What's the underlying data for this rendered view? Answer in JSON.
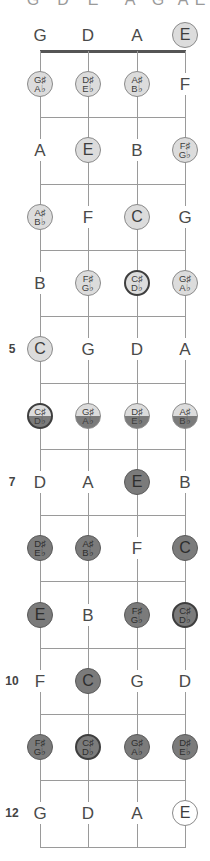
{
  "diagram": {
    "title_cutoff": [
      "G",
      "D",
      "E",
      "A",
      "G",
      "A",
      "E"
    ],
    "strings": [
      "G",
      "D",
      "A",
      "E"
    ],
    "string_x": [
      40,
      88,
      137,
      185
    ],
    "nut_y": 51,
    "fret_spacing": 66.3,
    "colors": {
      "line": "#9a9a9a",
      "nut": "#555555",
      "light_dot": "#dcdcdc",
      "dark_dot": "#7b7b7b",
      "text": "#4a4a4a"
    },
    "rows": [
      {
        "fret": 0,
        "label": "",
        "cells": [
          {
            "note": "G",
            "style": "plain"
          },
          {
            "note": "D",
            "style": "plain"
          },
          {
            "note": "A",
            "style": "plain"
          },
          {
            "note": "E",
            "style": "light"
          }
        ]
      },
      {
        "fret": 1,
        "label": "",
        "cells": [
          {
            "sharp": "G♯",
            "flat": "A♭",
            "style": "light"
          },
          {
            "sharp": "D♯",
            "flat": "E♭",
            "style": "light"
          },
          {
            "sharp": "A♯",
            "flat": "B♭",
            "style": "light"
          },
          {
            "note": "F",
            "style": "plain"
          }
        ]
      },
      {
        "fret": 2,
        "label": "",
        "cells": [
          {
            "note": "A",
            "style": "plain"
          },
          {
            "note": "E",
            "style": "light"
          },
          {
            "note": "B",
            "style": "plain"
          },
          {
            "sharp": "F♯",
            "flat": "G♭",
            "style": "light"
          }
        ]
      },
      {
        "fret": 3,
        "label": "",
        "cells": [
          {
            "sharp": "A♯",
            "flat": "B♭",
            "style": "light"
          },
          {
            "note": "F",
            "style": "plain"
          },
          {
            "note": "C",
            "style": "light"
          },
          {
            "note": "G",
            "style": "plain"
          }
        ]
      },
      {
        "fret": 4,
        "label": "",
        "cells": [
          {
            "note": "B",
            "style": "plain"
          },
          {
            "sharp": "F♯",
            "flat": "G♭",
            "style": "light"
          },
          {
            "sharp": "C♯",
            "flat": "D♭",
            "style": "light ring"
          },
          {
            "sharp": "G♯",
            "flat": "A♭",
            "style": "light"
          }
        ]
      },
      {
        "fret": 5,
        "label": "5",
        "cells": [
          {
            "note": "C",
            "style": "light"
          },
          {
            "note": "G",
            "style": "plain"
          },
          {
            "note": "D",
            "style": "plain"
          },
          {
            "note": "A",
            "style": "plain"
          }
        ]
      },
      {
        "fret": 6,
        "label": "",
        "cells": [
          {
            "sharp": "C♯",
            "flat": "D♭",
            "style": "split ring"
          },
          {
            "sharp": "G♯",
            "flat": "A♭",
            "style": "split"
          },
          {
            "sharp": "D♯",
            "flat": "E♭",
            "style": "split"
          },
          {
            "sharp": "A♯",
            "flat": "B♭",
            "style": "split"
          }
        ]
      },
      {
        "fret": 7,
        "label": "7",
        "cells": [
          {
            "note": "D",
            "style": "plain"
          },
          {
            "note": "A",
            "style": "plain"
          },
          {
            "note": "E",
            "style": "dark"
          },
          {
            "note": "B",
            "style": "plain"
          }
        ]
      },
      {
        "fret": 8,
        "label": "",
        "cells": [
          {
            "sharp": "D♯",
            "flat": "E♭",
            "style": "dark"
          },
          {
            "sharp": "A♯",
            "flat": "B♭",
            "style": "dark"
          },
          {
            "note": "F",
            "style": "plain"
          },
          {
            "note": "C",
            "style": "dark"
          }
        ]
      },
      {
        "fret": 9,
        "label": "",
        "cells": [
          {
            "note": "E",
            "style": "dark"
          },
          {
            "note": "B",
            "style": "plain"
          },
          {
            "sharp": "F♯",
            "flat": "G♭",
            "style": "dark"
          },
          {
            "sharp": "C♯",
            "flat": "D♭",
            "style": "dark ring"
          }
        ]
      },
      {
        "fret": 10,
        "label": "10",
        "cells": [
          {
            "note": "F",
            "style": "plain"
          },
          {
            "note": "C",
            "style": "dark"
          },
          {
            "note": "G",
            "style": "plain"
          },
          {
            "note": "D",
            "style": "plain"
          }
        ]
      },
      {
        "fret": 11,
        "label": "",
        "cells": [
          {
            "sharp": "F♯",
            "flat": "G♭",
            "style": "dark"
          },
          {
            "sharp": "C♯",
            "flat": "D♭",
            "style": "dark ring"
          },
          {
            "sharp": "G♯",
            "flat": "A♭",
            "style": "dark"
          },
          {
            "sharp": "D♯",
            "flat": "E♭",
            "style": "dark"
          }
        ]
      },
      {
        "fret": 12,
        "label": "12",
        "cells": [
          {
            "note": "G",
            "style": "plain"
          },
          {
            "note": "D",
            "style": "plain"
          },
          {
            "note": "A",
            "style": "plain"
          },
          {
            "note": "E",
            "style": "open"
          }
        ]
      }
    ]
  }
}
